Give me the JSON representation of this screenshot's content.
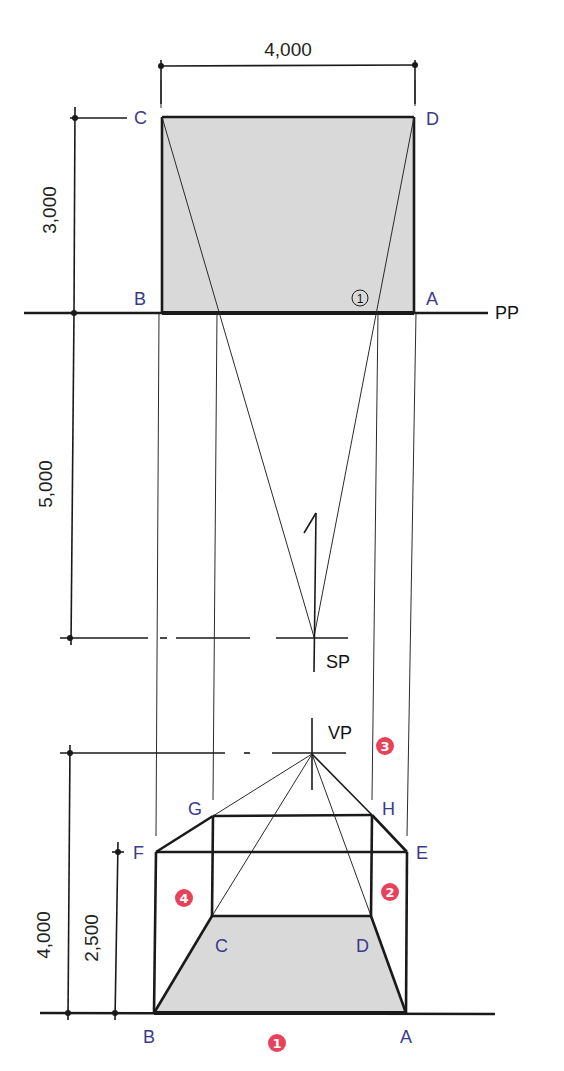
{
  "colors": {
    "background": "#ffffff",
    "line": "#1a1a1a",
    "plan_fill": "#d9d9d9",
    "point_label": "#3a3a8c",
    "step_badge": "#e8425a"
  },
  "dimensions": {
    "width_top": "4,000",
    "depth_plan": "3,000",
    "distance_pp_sp": "5,000",
    "eye_height": "4,000",
    "box_height": "2,500"
  },
  "plan": {
    "points": {
      "C": "C",
      "D": "D",
      "B": "B",
      "A": "A"
    },
    "intersection_marker": "1",
    "picture_plane": "PP",
    "station_point": "SP"
  },
  "perspective": {
    "vanishing_point": "VP",
    "points": {
      "G": "G",
      "H": "H",
      "F": "F",
      "E": "E",
      "C": "C",
      "D": "D",
      "B": "B",
      "A": "A"
    },
    "steps": [
      {
        "id": "step-1",
        "label": "1"
      },
      {
        "id": "step-2",
        "label": "2"
      },
      {
        "id": "step-3",
        "label": "3"
      },
      {
        "id": "step-4",
        "label": "4"
      }
    ]
  }
}
